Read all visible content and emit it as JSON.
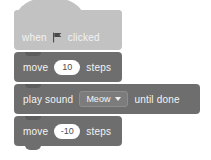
{
  "script": {
    "name": "scratch-script",
    "blocks": [
      {
        "id": "when-flag-clicked",
        "type": "hat",
        "category": "events",
        "color": "#c2c2c2",
        "text_before": "when",
        "icon": "green-flag-icon",
        "text_after": "clicked"
      },
      {
        "id": "move-10-steps",
        "type": "stack",
        "category": "motion",
        "color": "#6e6e6e",
        "text_before": "move",
        "input_value": "10",
        "text_after": "steps"
      },
      {
        "id": "play-sound-until-done",
        "type": "stack",
        "category": "sound",
        "color": "#6e6e6e",
        "text_before": "play sound",
        "dropdown_value": "Meow",
        "dropdown_caret": "chevron-down-icon",
        "text_after": "until done"
      },
      {
        "id": "move-neg10-steps",
        "type": "stack",
        "category": "motion",
        "color": "#6e6e6e",
        "text_before": "move",
        "input_value": "-10",
        "text_after": "steps"
      }
    ]
  },
  "colors": {
    "hat_block": "#c2c2c2",
    "stack_block": "#6e6e6e",
    "dropdown": "#7c7c7c",
    "input_field": "#ffffff",
    "label_text": "#f4f4f4",
    "input_text": "#4d4d4d",
    "canvas_background": "#ffffff"
  }
}
